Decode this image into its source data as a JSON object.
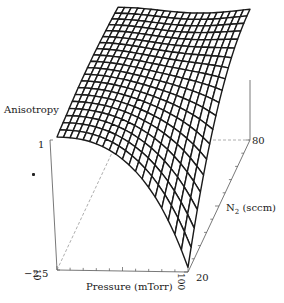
{
  "chart_data": {
    "type": "surface3d",
    "title": "",
    "zlabel": "Anisotropy",
    "xlabel": "Pressure (mTorr)",
    "ylabel": "N2 (sccm)",
    "ylabel_main": "N",
    "ylabel_sub": "2",
    "ylabel_rest": " (sccm)",
    "x_ticks": [
      "10",
      "100"
    ],
    "y_ticks": [
      "20",
      "80"
    ],
    "z_ticks": [
      "1",
      "-2.5"
    ],
    "z_tick_max": "1",
    "z_tick_min": "−2.5",
    "x_range": [
      10,
      100
    ],
    "y_range": [
      20,
      80
    ],
    "zlim": [
      -2.5,
      1
    ],
    "grid_resolution": [
      20,
      20
    ],
    "grid": false,
    "legend": "none"
  },
  "colors": {
    "mesh": "#1a1a1a",
    "axes": "#555555",
    "background": "#ffffff"
  }
}
